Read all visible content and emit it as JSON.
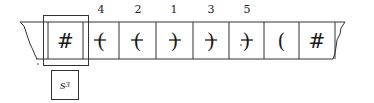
{
  "tape": {
    "cells": [
      {
        "symbol": "#",
        "order": ""
      },
      {
        "symbol": "(",
        "order": "4",
        "marked": true
      },
      {
        "symbol": "(",
        "order": "2",
        "marked": true
      },
      {
        "symbol": ")",
        "order": "1",
        "marked": true
      },
      {
        "symbol": ")",
        "order": "3",
        "marked": true
      },
      {
        "symbol": ")",
        "order": "5",
        "marked": true
      },
      {
        "symbol": "(",
        "order": ""
      },
      {
        "symbol": "#",
        "order": ""
      }
    ],
    "head_position": 0
  },
  "state": {
    "label": "s",
    "subscript": "3"
  },
  "colors": {
    "line": "#333333",
    "ink": "#1a1a1a"
  }
}
